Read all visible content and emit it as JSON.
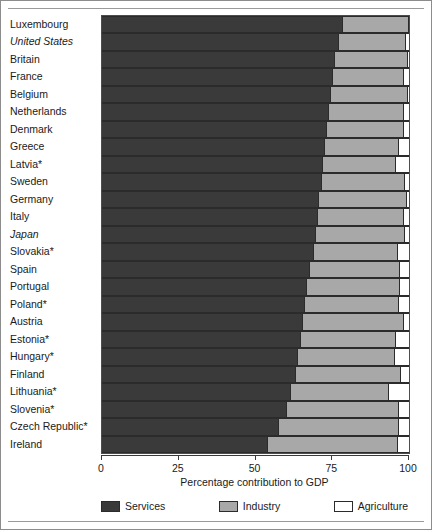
{
  "chart_data": {
    "type": "bar",
    "orientation": "horizontal",
    "stacked": true,
    "title": "",
    "xlabel": "Percentage contribution to GDP",
    "ylabel": "",
    "xlim": [
      0,
      100
    ],
    "xticks": [
      0,
      25,
      50,
      75,
      100
    ],
    "xtick_labels": [
      "0",
      "25",
      "50",
      "75",
      "100"
    ],
    "grid": false,
    "legend_position": "bottom",
    "legend": [
      "Services",
      "Industry",
      "Agriculture"
    ],
    "colors": {
      "services": "#3a3a3a",
      "industry": "#a8a8a8",
      "agriculture": "#ffffff",
      "outline": "#2b2b2b",
      "axis": "#3a3a3a",
      "frame": "#8c8c8c",
      "text": "#1a1a1a"
    },
    "footnote_marker": "*",
    "categories": [
      "Luxembourg",
      "United States",
      "Britain",
      "France",
      "Belgium",
      "Netherlands",
      "Denmark",
      "Greece",
      "Latvia*",
      "Sweden",
      "Germany",
      "Italy",
      "Japan",
      "Slovakia*",
      "Spain",
      "Portugal",
      "Poland*",
      "Austria",
      "Estonia*",
      "Hungary*",
      "Finland",
      "Lithuania*",
      "Slovenia*",
      "Czech Republic*",
      "Ireland"
    ],
    "series": [
      {
        "name": "Services",
        "values": [
          78.2,
          76.8,
          75.6,
          75.0,
          74.2,
          73.6,
          73.0,
          72.4,
          71.8,
          71.2,
          70.5,
          70.0,
          69.4,
          68.7,
          67.3,
          66.4,
          65.8,
          65.2,
          64.4,
          63.6,
          63.0,
          61.2,
          60.0,
          57.4,
          53.8
        ]
      },
      {
        "name": "Industry",
        "values": [
          21.5,
          21.9,
          23.9,
          23.1,
          25.1,
          24.5,
          25.2,
          24.0,
          23.7,
          27.2,
          28.5,
          28.0,
          28.9,
          27.5,
          29.3,
          30.2,
          30.5,
          32.8,
          31.1,
          31.5,
          34.0,
          32.0,
          36.5,
          38.9,
          42.2
        ]
      },
      {
        "name": "Agriculture",
        "values": [
          0.3,
          1.3,
          0.5,
          1.9,
          0.7,
          1.9,
          1.8,
          3.6,
          4.5,
          1.6,
          1.0,
          2.0,
          1.7,
          3.8,
          3.4,
          3.4,
          3.7,
          2.0,
          4.5,
          4.9,
          3.0,
          6.8,
          3.5,
          3.7,
          4.0
        ]
      }
    ],
    "rows": [
      {
        "label": "Luxembourg",
        "italic": false,
        "services": 78.2,
        "industry": 21.5,
        "agriculture": 0.3
      },
      {
        "label": "United States",
        "italic": true,
        "services": 76.8,
        "industry": 21.9,
        "agriculture": 1.3
      },
      {
        "label": "Britain",
        "italic": false,
        "services": 75.6,
        "industry": 23.9,
        "agriculture": 0.5
      },
      {
        "label": "France",
        "italic": false,
        "services": 75.0,
        "industry": 23.1,
        "agriculture": 1.9
      },
      {
        "label": "Belgium",
        "italic": false,
        "services": 74.2,
        "industry": 25.1,
        "agriculture": 0.7
      },
      {
        "label": "Netherlands",
        "italic": false,
        "services": 73.6,
        "industry": 24.5,
        "agriculture": 1.9
      },
      {
        "label": "Denmark",
        "italic": false,
        "services": 73.0,
        "industry": 25.2,
        "agriculture": 1.8
      },
      {
        "label": "Greece",
        "italic": false,
        "services": 72.4,
        "industry": 24.0,
        "agriculture": 3.6
      },
      {
        "label": "Latvia*",
        "italic": false,
        "services": 71.8,
        "industry": 23.7,
        "agriculture": 4.5
      },
      {
        "label": "Sweden",
        "italic": false,
        "services": 71.2,
        "industry": 27.2,
        "agriculture": 1.6
      },
      {
        "label": "Germany",
        "italic": false,
        "services": 70.5,
        "industry": 28.5,
        "agriculture": 1.0
      },
      {
        "label": "Italy",
        "italic": false,
        "services": 70.0,
        "industry": 28.0,
        "agriculture": 2.0
      },
      {
        "label": "Japan",
        "italic": true,
        "services": 69.4,
        "industry": 28.9,
        "agriculture": 1.7
      },
      {
        "label": "Slovakia*",
        "italic": false,
        "services": 68.7,
        "industry": 27.5,
        "agriculture": 3.8
      },
      {
        "label": "Spain",
        "italic": false,
        "services": 67.3,
        "industry": 29.3,
        "agriculture": 3.4
      },
      {
        "label": "Portugal",
        "italic": false,
        "services": 66.4,
        "industry": 30.2,
        "agriculture": 3.4
      },
      {
        "label": "Poland*",
        "italic": false,
        "services": 65.8,
        "industry": 30.5,
        "agriculture": 3.7
      },
      {
        "label": "Austria",
        "italic": false,
        "services": 65.2,
        "industry": 32.8,
        "agriculture": 2.0
      },
      {
        "label": "Estonia*",
        "italic": false,
        "services": 64.4,
        "industry": 31.1,
        "agriculture": 4.5
      },
      {
        "label": "Hungary*",
        "italic": false,
        "services": 63.6,
        "industry": 31.5,
        "agriculture": 4.9
      },
      {
        "label": "Finland",
        "italic": false,
        "services": 63.0,
        "industry": 34.0,
        "agriculture": 3.0
      },
      {
        "label": "Lithuania*",
        "italic": false,
        "services": 61.2,
        "industry": 32.0,
        "agriculture": 6.8
      },
      {
        "label": "Slovenia*",
        "italic": false,
        "services": 60.0,
        "industry": 36.5,
        "agriculture": 3.5
      },
      {
        "label": "Czech Republic*",
        "italic": false,
        "services": 57.4,
        "industry": 38.9,
        "agriculture": 3.7
      },
      {
        "label": "Ireland",
        "italic": false,
        "services": 53.8,
        "industry": 42.2,
        "agriculture": 4.0
      }
    ]
  }
}
